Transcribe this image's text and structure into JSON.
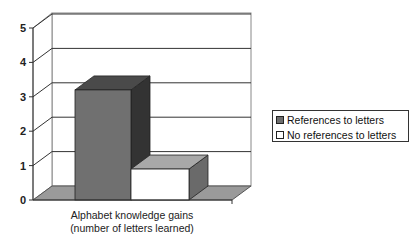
{
  "chart_data": {
    "type": "bar",
    "style": "3d-clustered",
    "title": "",
    "categories": [
      "Alphabet knowledge gains (number of letters learned)"
    ],
    "xlabel_lines": [
      "Alphabet knowledge gains",
      "(number of letters learned)"
    ],
    "ylabel": "",
    "ylim": [
      0,
      5
    ],
    "yticks": [
      "0",
      "1",
      "2",
      "3",
      "4",
      "5"
    ],
    "grid": true,
    "legend_position": "right",
    "series": [
      {
        "name": "References to letters",
        "values": [
          3.2
        ],
        "color": "#707070"
      },
      {
        "name": "No references to letters",
        "values": [
          0.9
        ],
        "color": "#ffffff"
      }
    ]
  },
  "legend": {
    "items": [
      {
        "label": "References to letters",
        "color": "#6e6e6e"
      },
      {
        "label": "No references to letters",
        "color": "#ffffff"
      }
    ]
  }
}
